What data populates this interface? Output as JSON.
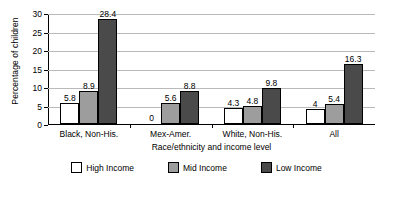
{
  "chart_data": {
    "type": "bar",
    "title": "",
    "xlabel": "Race/ethnicity and income level",
    "ylabel": "Percentage of children",
    "categories": [
      "Black, Non-His.",
      "Mex-Amer.",
      "White, Non-His.",
      "All"
    ],
    "series": [
      {
        "name": "High Income",
        "values": [
          5.8,
          0,
          4.3,
          4
        ],
        "color": "#ffffff"
      },
      {
        "name": "Mid Income",
        "values": [
          8.9,
          5.6,
          4.8,
          5.4
        ],
        "color": "#9d9d9d"
      },
      {
        "name": "Low Income",
        "values": [
          28.4,
          8.8,
          9.8,
          16.3
        ],
        "color": "#4a4a4a"
      }
    ],
    "value_labels": [
      [
        "5.8",
        "0",
        "4.3",
        "4"
      ],
      [
        "8.9",
        "5.6",
        "4.8",
        "5.4"
      ],
      [
        "28.4",
        "8.8",
        "9.8",
        "16.3"
      ]
    ],
    "ylim": [
      0,
      30
    ],
    "yticks": [
      0,
      5,
      10,
      15,
      20,
      25,
      30
    ],
    "ytick_labels": [
      "0",
      "5",
      "10",
      "15",
      "20",
      "25",
      "30"
    ],
    "grid": "horizontal",
    "legend_position": "bottom"
  }
}
